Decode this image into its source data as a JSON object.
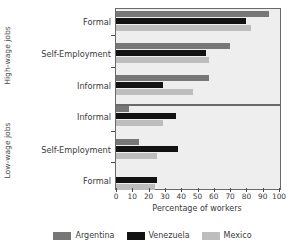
{
  "chart_data": {
    "type": "bar",
    "orientation": "horizontal",
    "title": "",
    "xlabel": "Percentage of workers",
    "ylabel": "",
    "xlim": [
      0,
      100
    ],
    "xticks": [
      0,
      10,
      20,
      30,
      40,
      50,
      60,
      70,
      80,
      90,
      100
    ],
    "grid": false,
    "legend_position": "bottom",
    "series": [
      {
        "name": "Argentina",
        "color": "#777777"
      },
      {
        "name": "Venezuela",
        "color": "#121212"
      },
      {
        "name": "Mexico",
        "color": "#bdbdbd"
      }
    ],
    "panels": [
      {
        "label": "High-wage jobs",
        "categories": [
          "Formal",
          "Self-Employment",
          "Informal"
        ],
        "values": {
          "Argentina": [
            94,
            70,
            57
          ],
          "Venezuela": [
            80,
            55,
            29
          ],
          "Mexico": [
            83,
            57,
            47
          ]
        }
      },
      {
        "label": "Low-wage jobs",
        "categories": [
          "Informal",
          "Self-Employment",
          "Formal"
        ],
        "values": {
          "Argentina": [
            8,
            14,
            0
          ],
          "Venezuela": [
            37,
            38,
            25
          ],
          "Mexico": [
            29,
            25,
            24
          ]
        }
      }
    ]
  },
  "axis": {
    "x_title": "Percentage of workers",
    "tick_labels": [
      "0",
      "10",
      "20",
      "30",
      "40",
      "50",
      "60",
      "70",
      "80",
      "90",
      "100"
    ]
  },
  "panels": {
    "high": {
      "group_label": "High-wage jobs",
      "rows": [
        {
          "label": "Formal"
        },
        {
          "label": "Self-Employment"
        },
        {
          "label": "Informal"
        }
      ]
    },
    "low": {
      "group_label": "Low-wage jobs",
      "rows": [
        {
          "label": "Informal"
        },
        {
          "label": "Self-Employment"
        },
        {
          "label": "Formal"
        }
      ]
    }
  },
  "legend": {
    "items": [
      {
        "label": "Argentina",
        "color": "#777777"
      },
      {
        "label": "Venezuela",
        "color": "#121212"
      },
      {
        "label": "Mexico",
        "color": "#bdbdbd"
      }
    ]
  }
}
